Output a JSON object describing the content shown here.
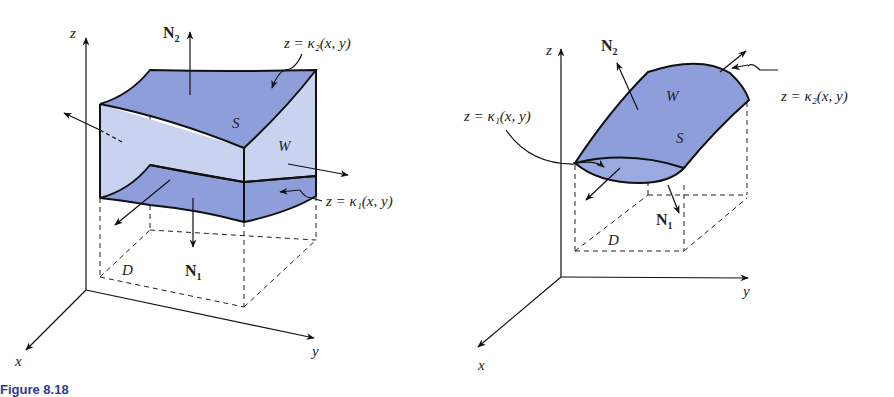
{
  "figure": {
    "caption_prefix": "Figure 8.18",
    "colors": {
      "surface_dark": "#8e9edb",
      "surface_light": "#c9d3f0",
      "outline": "#111111",
      "caption": "#2a3a9a"
    },
    "left_panel": {
      "axis_labels": {
        "x": "x",
        "y": "y",
        "z": "z"
      },
      "normal_top": "N",
      "normal_top_sub": "2",
      "normal_bottom": "N",
      "normal_bottom_sub": "1",
      "surface_label": "S",
      "region_label": "W",
      "domain_label": "D",
      "top_surface_eq": "z = κ₂(x, y)",
      "bottom_surface_eq": "z = κ₁(x, y)"
    },
    "right_panel": {
      "axis_labels": {
        "x": "x",
        "y": "y",
        "z": "z"
      },
      "normal_top": "N",
      "normal_top_sub": "2",
      "normal_bottom": "N",
      "normal_bottom_sub": "1",
      "surface_label": "S",
      "region_label": "W",
      "domain_label": "D",
      "top_surface_eq": "z = κ₂(x, y)",
      "bottom_surface_eq": "z = κ₁(x, y)"
    }
  }
}
